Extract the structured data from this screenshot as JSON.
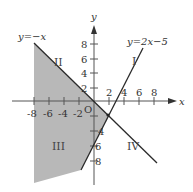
{
  "diagram": {
    "axes": {
      "x_label": "x",
      "y_label": "y",
      "origin_label": "O",
      "x_ticks": [
        "-8",
        "-6",
        "-4",
        "-2",
        "2",
        "4",
        "6",
        "8"
      ],
      "y_ticks_pos": [
        "8",
        "6",
        "4",
        "2"
      ],
      "y_ticks_neg": [
        "4",
        "6",
        "8"
      ]
    },
    "lines": [
      {
        "label": "y=−x",
        "equation": "y = -x"
      },
      {
        "label": "y=2x−5",
        "equation": "y = 2x - 5"
      }
    ],
    "regions": {
      "I": "I",
      "II": "II",
      "III": "III",
      "IV": "IV"
    },
    "shaded_region": "left of y=-x and y=2x-5 (region III and part of II)",
    "colors": {
      "shade": "#b8b8b8",
      "line": "#2a2a2a",
      "axis": "#555555"
    }
  }
}
